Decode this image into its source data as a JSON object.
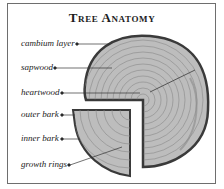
{
  "title": "Tree Anatomy",
  "labels": [
    {
      "id": "cambium",
      "text": "cambium layer"
    },
    {
      "id": "sapwood",
      "text": "sapwood"
    },
    {
      "id": "heartwood",
      "text": "heartwood"
    },
    {
      "id": "outer_bark",
      "text": "outer bark"
    },
    {
      "id": "inner_bark",
      "text": "inner bark"
    },
    {
      "id": "growth_rings",
      "text": "growth rings"
    }
  ],
  "colors": {
    "border": "#6e6e6e",
    "bark": "#3a3a3a",
    "wood": "#b9b9b9",
    "rings": "#8a8a8a",
    "leader": "#333333"
  }
}
